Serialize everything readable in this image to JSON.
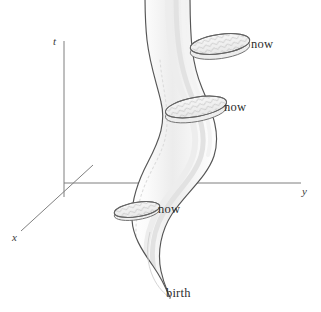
{
  "axes": {
    "vertical": {
      "name": "t",
      "label": "t"
    },
    "horizontal": {
      "name": "y",
      "label": "y"
    },
    "depth": {
      "name": "x",
      "label": "x"
    },
    "origin": {
      "x": 64,
      "y": 183
    },
    "color": "#7a7a7a"
  },
  "annotations": [
    {
      "id": "now-1",
      "label": "now",
      "anchor": {
        "x": 222,
        "y": 45
      }
    },
    {
      "id": "now-2",
      "label": "now",
      "anchor": {
        "x": 196,
        "y": 108
      }
    },
    {
      "id": "now-3",
      "label": "now",
      "anchor": {
        "x": 137,
        "y": 210
      }
    },
    {
      "id": "birth-1",
      "label": "birth",
      "anchor": {
        "x": 168,
        "y": 286
      }
    }
  ],
  "worldtube": {
    "outline_color": "#585858",
    "fill_color": "#fdfdfd",
    "shading_color": "#e9e9e9",
    "slice_fill": "#f2f2f2",
    "slice_outline": "#6a6a6a",
    "slice_hatch_color": "#9a9a9a"
  },
  "colors": {
    "background": "#ffffff",
    "ink": "#2e2e2e",
    "axis": "#7a7a7a",
    "outline": "#585858"
  }
}
